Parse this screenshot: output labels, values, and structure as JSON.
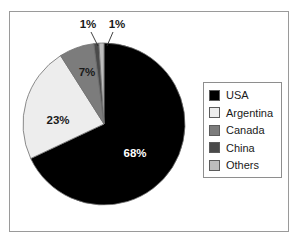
{
  "chart_data": {
    "type": "pie",
    "title": "",
    "subtitle": "",
    "xlabel": "",
    "ylabel": "",
    "grid": false,
    "legend_position": "right",
    "start_angle_deg": 0,
    "direction": "clockwise",
    "categories": [
      "USA",
      "Argentina",
      "Canada",
      "China",
      "Others"
    ],
    "values": [
      68,
      23,
      7,
      1,
      1
    ],
    "value_unit": "%",
    "data_labels": [
      "68%",
      "23%",
      "7%",
      "1%",
      "1%"
    ],
    "slice_colors": [
      "#000000",
      "#ededed",
      "#7c7c7c",
      "#4a4a4a",
      "#bdbdbd"
    ],
    "slices": [
      {
        "label": "USA",
        "value": 68,
        "data_label": "68%",
        "color": "#000000",
        "label_on_dark": true,
        "callout": false
      },
      {
        "label": "Argentina",
        "value": 23,
        "data_label": "23%",
        "color": "#ededed",
        "label_on_dark": false,
        "callout": false
      },
      {
        "label": "Canada",
        "value": 7,
        "data_label": "7%",
        "color": "#7c7c7c",
        "label_on_dark": false,
        "callout": false
      },
      {
        "label": "China",
        "value": 1,
        "data_label": "1%",
        "color": "#4a4a4a",
        "label_on_dark": false,
        "callout": true
      },
      {
        "label": "Others",
        "value": 1,
        "data_label": "1%",
        "color": "#bdbdbd",
        "label_on_dark": false,
        "callout": true
      }
    ],
    "legend": [
      {
        "label": "USA",
        "color": "#000000"
      },
      {
        "label": "Argentina",
        "color": "#ededed"
      },
      {
        "label": "Canada",
        "color": "#7c7c7c"
      },
      {
        "label": "China",
        "color": "#4a4a4a"
      },
      {
        "label": "Others",
        "color": "#bdbdbd"
      }
    ]
  },
  "labels": {
    "usa_value": "68%",
    "argentina_value": "23%",
    "canada_value": "7%",
    "china_value": "1%",
    "others_value": "1%"
  },
  "legend_labels": {
    "row0": "USA",
    "row1": "Argentina",
    "row2": "Canada",
    "row3": "China",
    "row4": "Others"
  },
  "colors": {
    "frame_border": "#9a9a9a",
    "legend_border": "#8e8e8e",
    "slice_outline": "#6f6f6f",
    "background": "#ffffff"
  }
}
